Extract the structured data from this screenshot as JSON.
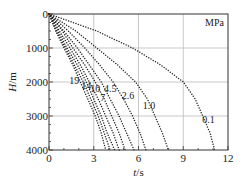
{
  "chart_data": {
    "type": "scatter",
    "title": "",
    "xlabel": "t/s",
    "ylabel": "H/m",
    "xlim": [
      0,
      12
    ],
    "ylim": [
      4000,
      0
    ],
    "y_inverted": true,
    "x_ticks": [
      "0",
      "3",
      "6",
      "9",
      "12"
    ],
    "y_ticks": [
      "0",
      "1000",
      "2000",
      "3000",
      "4000"
    ],
    "grid": true,
    "unit_annotation": "MPa",
    "legend_position": "none (inline curve labels)",
    "H": [
      0,
      500,
      1000,
      1500,
      2000,
      2500,
      3000,
      3500,
      4000
    ],
    "series": [
      {
        "name": "0.1",
        "t": [
          0,
          3.2,
          5.6,
          7.5,
          9.0,
          9.8,
          10.3,
          10.8,
          11.1
        ]
      },
      {
        "name": "1.0",
        "t": [
          0,
          1.8,
          3.2,
          4.6,
          5.8,
          6.6,
          7.1,
          7.6,
          8.0
        ]
      },
      {
        "name": "2.6",
        "t": [
          0,
          1.3,
          2.4,
          3.4,
          4.3,
          5.0,
          5.6,
          6.1,
          6.5
        ]
      },
      {
        "name": "4.5",
        "t": [
          0,
          1.0,
          1.9,
          2.7,
          3.5,
          4.1,
          4.7,
          5.2,
          5.7
        ]
      },
      {
        "name": "7",
        "t": [
          0,
          0.9,
          1.6,
          2.4,
          3.1,
          3.7,
          4.2,
          4.7,
          5.1
        ]
      },
      {
        "name": "10",
        "t": [
          0,
          0.7,
          1.4,
          2.1,
          2.7,
          3.3,
          3.8,
          4.3,
          4.7
        ]
      },
      {
        "name": "14",
        "t": [
          0,
          0.6,
          1.2,
          1.9,
          2.5,
          3.0,
          3.5,
          3.9,
          4.4
        ]
      },
      {
        "name": "19",
        "t": [
          0,
          0.5,
          1.1,
          1.7,
          2.3,
          2.8,
          3.3,
          3.7,
          4.1
        ]
      },
      {
        "name": "",
        "t": [
          0,
          0.45,
          1.0,
          1.6,
          2.1,
          2.6,
          3.1,
          3.5,
          3.8
        ]
      }
    ],
    "annotations": [
      {
        "text": "19",
        "t": 1.7,
        "H": 2050
      },
      {
        "text": "14",
        "t": 2.5,
        "H": 2200
      },
      {
        "text": "10",
        "t": 3.1,
        "H": 2300
      },
      {
        "text": "4.5",
        "t": 4.1,
        "H": 2300
      },
      {
        "text": "7",
        "t": 3.6,
        "H": 2550
      },
      {
        "text": "2.6",
        "t": 5.3,
        "H": 2500
      },
      {
        "text": "1.0",
        "t": 6.7,
        "H": 2800
      },
      {
        "text": "0.1",
        "t": 10.7,
        "H": 3200
      }
    ]
  }
}
